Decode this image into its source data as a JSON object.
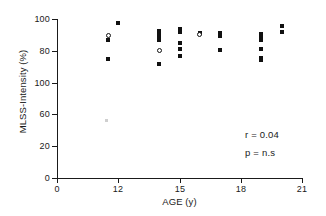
{
  "chart_data": {
    "type": "scatter",
    "title": "",
    "xlabel": "AGE (y)",
    "ylabel": "MLSS-Intensity (%)",
    "xlim": [
      0,
      21
    ],
    "ylim": [
      0,
      100
    ],
    "grid": false,
    "legend": "none",
    "frame": "left-bottom",
    "x_ticks": [
      {
        "label": "0",
        "value": 0
      },
      {
        "label": "12",
        "value": 12
      },
      {
        "label": "15",
        "value": 15
      },
      {
        "label": "18",
        "value": 18
      },
      {
        "label": "21",
        "value": 21
      }
    ],
    "y_ticks": [
      {
        "label": "100",
        "value": 100
      },
      {
        "label": "80",
        "value": 80
      },
      {
        "label": "100",
        "value": 60
      },
      {
        "label": "60",
        "value": 40
      },
      {
        "label": "20",
        "value": 20
      },
      {
        "label": "0",
        "value": 0
      }
    ],
    "series": [
      {
        "name": "filled-square",
        "marker": "filled-square",
        "color": "#111111",
        "points": [
          {
            "x": 10.0,
            "y": 87.0
          },
          {
            "x": 10.0,
            "y": 75.0
          },
          {
            "x": 12.0,
            "y": 97.5
          },
          {
            "x": 14.0,
            "y": 92.5
          },
          {
            "x": 14.0,
            "y": 91.0
          },
          {
            "x": 14.0,
            "y": 89.5
          },
          {
            "x": 14.0,
            "y": 88.0
          },
          {
            "x": 14.0,
            "y": 86.5
          },
          {
            "x": 14.0,
            "y": 72.0
          },
          {
            "x": 15.0,
            "y": 93.5
          },
          {
            "x": 15.0,
            "y": 92.0
          },
          {
            "x": 15.0,
            "y": 85.0
          },
          {
            "x": 15.0,
            "y": 81.0
          },
          {
            "x": 15.0,
            "y": 77.0
          },
          {
            "x": 16.0,
            "y": 91.5
          },
          {
            "x": 17.0,
            "y": 91.0
          },
          {
            "x": 17.0,
            "y": 89.5
          },
          {
            "x": 17.0,
            "y": 80.5
          },
          {
            "x": 19.0,
            "y": 90.5
          },
          {
            "x": 19.0,
            "y": 89.0
          },
          {
            "x": 19.0,
            "y": 86.5
          },
          {
            "x": 19.0,
            "y": 81.0
          },
          {
            "x": 19.0,
            "y": 75.5
          },
          {
            "x": 19.0,
            "y": 74.0
          },
          {
            "x": 20.0,
            "y": 95.5
          },
          {
            "x": 20.0,
            "y": 92.0
          }
        ]
      },
      {
        "name": "open-circle",
        "marker": "open-circle",
        "color": "#111111",
        "points": [
          {
            "x": 10.0,
            "y": 89.5
          },
          {
            "x": 14.0,
            "y": 80.0
          },
          {
            "x": 16.0,
            "y": 90.0
          }
        ]
      }
    ],
    "annotations": [
      {
        "id": "r",
        "text": "r = 0.04"
      },
      {
        "id": "p",
        "text": "p = n.s"
      }
    ]
  },
  "axes": {
    "y_title": "MLSS-Intensity (%)",
    "x_title": "AGE (y)",
    "y_labels": [
      "100",
      "80",
      "100",
      "60",
      "20",
      "0"
    ],
    "x_labels": [
      "0",
      "12",
      "15",
      "18",
      "21"
    ]
  },
  "stats": {
    "r_text": "r = 0.04",
    "p_text": "p = n.s"
  }
}
